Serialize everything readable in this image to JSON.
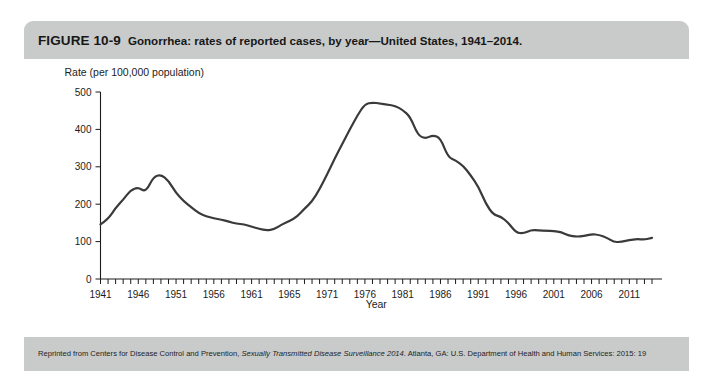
{
  "figure": {
    "label": "FIGURE 10-9",
    "caption": "Gonorrhea: rates of reported cases, by year—United States, 1941–2014.",
    "credit_prefix": "Reprinted from Centers for Disease Control and Prevention, ",
    "credit_italic": "Sexually Transmitted Disease Surveillance 2014",
    "credit_suffix": ". Atlanta, GA: U.S. Department of Health and Human Services: 2015: 19",
    "header_bg": "#c9cbcb",
    "body_bg": "#ffffff",
    "line_color": "#3a3a3a",
    "text_color": "#1c1c1c"
  },
  "chart_data": {
    "type": "line",
    "title": "",
    "ylabel": "Rate (per 100,000 population)",
    "xlabel": "Year",
    "ylim": [
      0,
      500
    ],
    "xlim": [
      1941,
      2014
    ],
    "grid": false,
    "legend": false,
    "y_ticks": [
      0,
      100,
      200,
      300,
      400,
      500
    ],
    "y_tick_labels": [
      "0",
      "100",
      "200",
      "300",
      "400",
      "500"
    ],
    "x_tick_labels": [
      "1941",
      "1946",
      "1951",
      "1956",
      "1961",
      "1965",
      "1971",
      "1976",
      "1981",
      "1986",
      "1991",
      "1996",
      "2001",
      "2006",
      "2011"
    ],
    "x_tick_label_years": [
      1941,
      1946,
      1951,
      1956,
      1961,
      1966,
      1971,
      1976,
      1981,
      1986,
      1991,
      1996,
      2001,
      2006,
      2011
    ],
    "x_minor_tick_interval": 1,
    "series": [
      {
        "name": "Gonorrhea rate",
        "x": [
          1941,
          1942,
          1943,
          1944,
          1945,
          1946,
          1947,
          1948,
          1949,
          1950,
          1951,
          1952,
          1953,
          1954,
          1955,
          1956,
          1957,
          1958,
          1959,
          1960,
          1961,
          1962,
          1963,
          1964,
          1965,
          1966,
          1967,
          1968,
          1969,
          1970,
          1971,
          1972,
          1973,
          1974,
          1975,
          1976,
          1977,
          1978,
          1979,
          1980,
          1981,
          1982,
          1983,
          1984,
          1985,
          1986,
          1987,
          1988,
          1989,
          1990,
          1991,
          1992,
          1993,
          1994,
          1995,
          1996,
          1997,
          1998,
          1999,
          2000,
          2001,
          2002,
          2003,
          2004,
          2005,
          2006,
          2007,
          2008,
          2009,
          2010,
          2011,
          2012,
          2013,
          2014
        ],
        "y": [
          146,
          160,
          190,
          212,
          238,
          245,
          232,
          273,
          279,
          263,
          230,
          208,
          192,
          176,
          168,
          162,
          159,
          153,
          148,
          146,
          140,
          134,
          130,
          133,
          146,
          155,
          166,
          188,
          207,
          240,
          280,
          322,
          361,
          400,
          437,
          468,
          472,
          469,
          466,
          463,
          452,
          434,
          385,
          375,
          385,
          377,
          326,
          317,
          303,
          277,
          248,
          201,
          172,
          167,
          150,
          124,
          122,
          131,
          130,
          129,
          128,
          125,
          116,
          113,
          115,
          120,
          118,
          111,
          98,
          100,
          104,
          107,
          105,
          110
        ],
        "color": "#3a3a3a"
      }
    ]
  }
}
